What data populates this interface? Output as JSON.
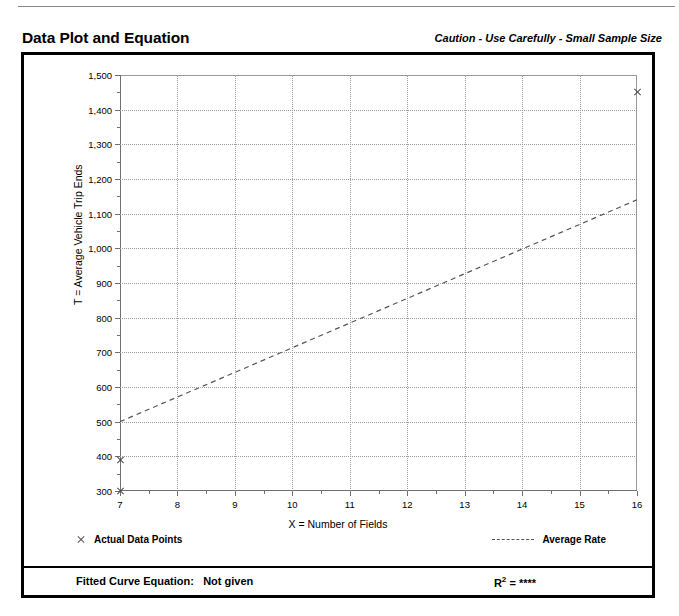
{
  "header": {
    "title": "Data Plot and Equation",
    "caution": "Caution - Use Carefully - Small Sample Size"
  },
  "footer": {
    "equation_label": "Fitted Curve Equation:",
    "equation_value": "Not given",
    "rsq_label": "R",
    "rsq_exponent": "2",
    "rsq_equals": "=",
    "rsq_value": "****"
  },
  "legend": {
    "data_points_label": "Actual Data Points",
    "average_rate_label": "Average Rate",
    "marker_icon": "x-marker-icon",
    "line_icon": "dashed-line-icon"
  },
  "chart_data": {
    "type": "scatter",
    "title": "Data Plot and Equation",
    "xlabel": "X = Number of Fields",
    "ylabel": "T = Average Vehicle Trip Ends",
    "xlim": [
      7,
      16
    ],
    "ylim": [
      300,
      1500
    ],
    "xticks": [
      7,
      8,
      9,
      10,
      11,
      12,
      13,
      14,
      15,
      16
    ],
    "xtick_labels": [
      "7",
      "8",
      "9",
      "10",
      "11",
      "12",
      "13",
      "14",
      "15",
      "16"
    ],
    "x_minor_ticks": [
      7.5,
      8.5,
      9.5,
      10.5,
      11.5,
      12.5,
      13.5,
      14.5,
      15.5
    ],
    "yticks": [
      300,
      400,
      500,
      600,
      700,
      800,
      900,
      1000,
      1100,
      1200,
      1300,
      1400,
      1500
    ],
    "ytick_labels": [
      "300",
      "400",
      "500",
      "600",
      "700",
      "800",
      "900",
      "1,000",
      "1,100",
      "1,200",
      "1,300",
      "1,400",
      "1,500"
    ],
    "y_minor_ticks": [
      350,
      450,
      550,
      650,
      750,
      850,
      950,
      1050,
      1150,
      1250,
      1350,
      1450
    ],
    "grid": true,
    "grid_style": "dotted",
    "legend_position": "below-plot",
    "series": [
      {
        "name": "Actual Data Points",
        "type": "scatter",
        "marker": "x",
        "color": "#4a4a4a",
        "points": [
          {
            "x": 7,
            "y": 300
          },
          {
            "x": 7,
            "y": 390
          },
          {
            "x": 16,
            "y": 1450
          }
        ]
      },
      {
        "name": "Average Rate",
        "type": "line",
        "style": "dashed",
        "color": "#555555",
        "points": [
          {
            "x": 7,
            "y": 500
          },
          {
            "x": 16,
            "y": 1140
          }
        ]
      }
    ]
  }
}
